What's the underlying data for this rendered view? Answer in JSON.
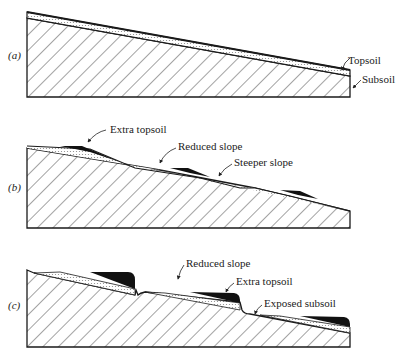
{
  "figure": {
    "colors": {
      "outline": "#1a1a1a",
      "hatch": "#333333",
      "topsoil_stipple": "#bbbbbb",
      "extra_topsoil": "#111111",
      "background": "#ffffff"
    },
    "panels": [
      {
        "id": "a",
        "label": "(a)",
        "annotations": [
          {
            "text": "Topsoil"
          },
          {
            "text": "Subsoil"
          }
        ]
      },
      {
        "id": "b",
        "label": "(b)",
        "annotations": [
          {
            "text": "Extra topsoil"
          },
          {
            "text": "Reduced slope"
          },
          {
            "text": "Steeper slope"
          }
        ]
      },
      {
        "id": "c",
        "label": "(c)",
        "annotations": [
          {
            "text": "Reduced slope"
          },
          {
            "text": "Extra topsoil"
          },
          {
            "text": "Exposed subsoil"
          }
        ]
      }
    ]
  }
}
